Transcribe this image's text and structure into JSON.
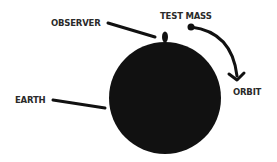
{
  "diagram": {
    "labels": {
      "observer": "OBSERVER",
      "test_mass": "TEST MASS",
      "orbit": "ORBIT",
      "earth": "EARTH"
    },
    "colors": {
      "ink": "#111111",
      "text": "#2a2a2a",
      "background": "#ffffff"
    }
  }
}
